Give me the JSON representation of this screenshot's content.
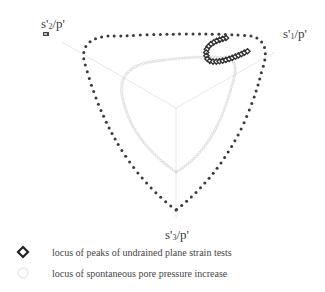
{
  "figure": {
    "type": "deviatoric-plane diagram",
    "axes": [
      {
        "id": "s1",
        "label_main": "s'",
        "label_sub": "1",
        "label_tail": "/p'",
        "direction_deg": 30
      },
      {
        "id": "s2",
        "label_main": "s'",
        "label_sub": "2",
        "label_tail": "/p'",
        "direction_deg": 150
      },
      {
        "id": "s3",
        "label_main": "s'",
        "label_sub": "3",
        "label_tail": "/p'",
        "direction_deg": 270
      }
    ],
    "colors": {
      "outer_locus": "#3a3a3a",
      "inner_locus": "#d8d8d8",
      "axes": "#e6e6e6",
      "peaks_marker": "#333333",
      "text": "#3a3a3a"
    },
    "curves": {
      "outer_locus": "dark dotted rounded-triangle failure surface",
      "inner_locus": "light gray small-circle rounded-triangle",
      "peaks_cluster": "C-shaped cluster of diamond markers near s'1 axis"
    }
  },
  "legend": {
    "items": [
      {
        "symbol": "diamond-open-bold",
        "label": "locus of peaks of undrained plane strain tests"
      },
      {
        "symbol": "circle-open-light",
        "label": "locus of spontaneous pore pressure increase"
      }
    ]
  }
}
